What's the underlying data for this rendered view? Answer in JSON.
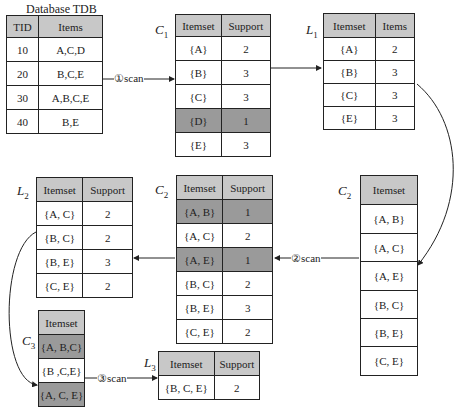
{
  "database": {
    "title": "Database TDB",
    "headers": [
      "TID",
      "Items"
    ],
    "rows": [
      [
        "10",
        "A,C,D"
      ],
      [
        "20",
        "B,C,E"
      ],
      [
        "30",
        "A,B,C,E"
      ],
      [
        "40",
        "B,E"
      ]
    ]
  },
  "c1": {
    "label": "C",
    "sub": "1",
    "headers": [
      "Itemset",
      "Support"
    ],
    "rows": [
      [
        "{A}",
        "2"
      ],
      [
        "{B}",
        "3"
      ],
      [
        "{C}",
        "3"
      ],
      [
        "{D}",
        "1"
      ],
      [
        "{E}",
        "3"
      ]
    ],
    "highlighted": [
      3
    ]
  },
  "l1": {
    "label": "L",
    "sub": "1",
    "headers": [
      "Itemset",
      "Items"
    ],
    "rows": [
      [
        "{A}",
        "2"
      ],
      [
        "{B}",
        "3"
      ],
      [
        "{C}",
        "3"
      ],
      [
        "{E}",
        "3"
      ]
    ]
  },
  "c2_list": {
    "label": "C",
    "sub": "2",
    "headers": [
      "Itemset"
    ],
    "rows": [
      [
        "{A, B}"
      ],
      [
        "{A, C}"
      ],
      [
        "{A, E}"
      ],
      [
        "{B, C}"
      ],
      [
        "{B, E}"
      ],
      [
        "{C, E}"
      ]
    ]
  },
  "c2": {
    "label": "C",
    "sub": "2",
    "headers": [
      "Itemset",
      "Support"
    ],
    "rows": [
      [
        "{A, B}",
        "1"
      ],
      [
        "{A, C}",
        "2"
      ],
      [
        "{A, E}",
        "1"
      ],
      [
        "{B, C}",
        "2"
      ],
      [
        "{B, E}",
        "3"
      ],
      [
        "{C, E}",
        "2"
      ]
    ],
    "highlighted": [
      0,
      2
    ]
  },
  "l2": {
    "label": "L",
    "sub": "2",
    "headers": [
      "Itemset",
      "Support"
    ],
    "rows": [
      [
        "{A, C}",
        "2"
      ],
      [
        "{B, C}",
        "2"
      ],
      [
        "{B, E}",
        "3"
      ],
      [
        "{C, E}",
        "2"
      ]
    ]
  },
  "c3": {
    "label": "C",
    "sub": "3",
    "headers": [
      "Itemset"
    ],
    "rows": [
      [
        "{A, B,C}"
      ],
      [
        "{B ,C,E}"
      ],
      [
        "{A, C, E}"
      ]
    ],
    "highlighted": [
      0,
      2
    ]
  },
  "l3": {
    "label": "L",
    "sub": "3",
    "headers": [
      "Itemset",
      "Support"
    ],
    "rows": [
      [
        "{B, C, E}",
        "2"
      ]
    ]
  },
  "scans": {
    "s1": "①scan",
    "s2": "②scan",
    "s3": "③scan"
  }
}
